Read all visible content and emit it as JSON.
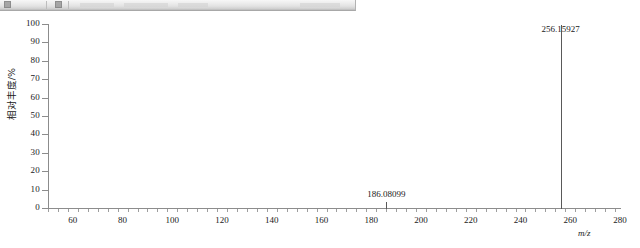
{
  "toolbar": {
    "visible": true,
    "truncated": true,
    "icons": [
      "toolbar-button-icon",
      "toolbar-button-icon"
    ]
  },
  "chart_data": {
    "type": "bar",
    "chart_kind": "mass-spectrum",
    "title": "",
    "xlabel": "m/z",
    "ylabel": "相对丰度/%",
    "xlim": [
      50,
      280
    ],
    "ylim": [
      0,
      100
    ],
    "grid": false,
    "legend": false,
    "x_major_step": 20,
    "x_minor_per_major": 5,
    "y_major_step": 10,
    "x_ticks": [
      60,
      80,
      100,
      120,
      140,
      160,
      180,
      200,
      220,
      240,
      260,
      280
    ],
    "x_tick_labels": [
      "60",
      "80",
      "100",
      "120",
      "140",
      "160",
      "180",
      "200",
      "220",
      "240",
      "260",
      "280"
    ],
    "y_ticks": [
      0,
      10,
      20,
      30,
      40,
      50,
      60,
      70,
      80,
      90,
      100
    ],
    "y_tick_labels": [
      "0",
      "10",
      "20",
      "30",
      "40",
      "50",
      "60",
      "70",
      "80",
      "90",
      "100"
    ],
    "peaks": [
      {
        "mz": 186.08099,
        "intensity": 4,
        "label": "186.08099"
      },
      {
        "mz": 256.15927,
        "intensity": 100,
        "label": "256.15927"
      }
    ],
    "base_peak_label": "256.15927",
    "secondary_peak_label": "186.08099"
  },
  "colors": {
    "axis": "#8c8c8c",
    "peak": "#595959",
    "text": "#1a1a1a",
    "toolbar_face": "#e2e2e2",
    "plot_background": "#ffffff"
  }
}
